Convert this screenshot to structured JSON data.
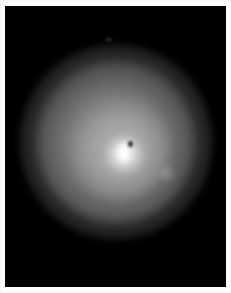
{
  "image": {
    "kind": "astronomical-photograph",
    "title": "Diffuse halo around a bright compact nucleus",
    "border_color": "#fdfdfd",
    "sky_color": "#000000"
  },
  "plate": {
    "label": "photographic-plate",
    "width_px": 221,
    "height_px": 281,
    "offset_x_px": 5,
    "offset_y_px": 6
  },
  "objects": {
    "core": {
      "label": "bright-nucleus",
      "center_x_px": 119,
      "center_y_px": 146,
      "peak_color": "#ffffff"
    },
    "dark_notch": {
      "label": "dark-absorption-notch",
      "center_x_px": 125,
      "center_y_px": 138,
      "color": "#282828"
    },
    "companion": {
      "label": "faint-companion-knot",
      "center_x_px": 161,
      "center_y_px": 167,
      "color": "#acacac"
    },
    "field_object": {
      "label": "faint-field-object",
      "center_x_px": 104,
      "center_y_px": 33,
      "color": "#464646"
    },
    "halo": {
      "label": "diffuse-circular-halo",
      "center_x_px": 111,
      "center_y_px": 136,
      "outer_radius_px": 97,
      "mid_radius_px": 78,
      "inner_radius_px": 50,
      "mid_color": "#969696",
      "outer_color": "#767676",
      "inner_color": "#bababa"
    }
  }
}
